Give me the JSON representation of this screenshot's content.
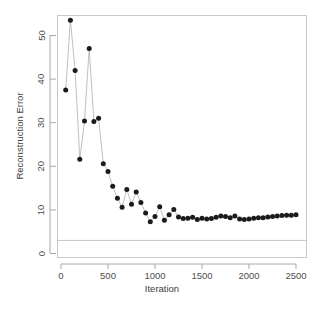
{
  "chart_data": {
    "type": "line",
    "title": "",
    "xlabel": "Iteration",
    "ylabel": "Reconstruction Error",
    "xlim": [
      0,
      2600
    ],
    "ylim": [
      0,
      56
    ],
    "xticks": [
      0,
      500,
      1000,
      1500,
      2000,
      2500
    ],
    "xtick_labels": [
      "0",
      "500",
      "1000",
      "1500",
      "2000",
      "2500"
    ],
    "yticks": [
      0,
      10,
      20,
      30,
      40,
      50
    ],
    "ytick_labels": [
      "0",
      "10",
      "20",
      "30",
      "40",
      "50"
    ],
    "grid": false,
    "legend": false,
    "marker": "filled-circle",
    "marker_color": "#1b1b1b",
    "line_color": "#b0b0b0",
    "frame_color": "#c9c9c9",
    "reference_lines": [
      {
        "orientation": "horizontal",
        "y": 3.0,
        "color": "#c4c4c4"
      }
    ],
    "series": [
      {
        "name": "Reconstruction Error",
        "x": [
          50,
          100,
          150,
          200,
          250,
          300,
          350,
          400,
          450,
          500,
          550,
          600,
          650,
          700,
          750,
          800,
          850,
          900,
          950,
          1000,
          1050,
          1100,
          1150,
          1200,
          1250,
          1300,
          1350,
          1400,
          1450,
          1500,
          1550,
          1600,
          1650,
          1700,
          1750,
          1800,
          1850,
          1900,
          1950,
          2000,
          2050,
          2100,
          2150,
          2200,
          2250,
          2300,
          2350,
          2400,
          2450,
          2500
        ],
        "y": [
          37.5,
          53.5,
          42.0,
          21.6,
          30.4,
          47.0,
          30.3,
          31.0,
          20.6,
          18.8,
          15.4,
          12.7,
          10.6,
          14.7,
          11.3,
          14.1,
          11.7,
          9.3,
          7.3,
          8.5,
          10.7,
          7.6,
          8.9,
          10.1,
          8.4,
          8.0,
          8.1,
          8.3,
          7.8,
          8.1,
          7.9,
          8.0,
          8.3,
          8.6,
          8.5,
          8.2,
          8.6,
          7.9,
          7.8,
          7.9,
          8.1,
          8.2,
          8.2,
          8.4,
          8.5,
          8.6,
          8.7,
          8.8,
          8.8,
          8.9
        ]
      }
    ]
  },
  "axes": {
    "y_title": "Reconstruction Error",
    "x_title": "Iteration"
  }
}
